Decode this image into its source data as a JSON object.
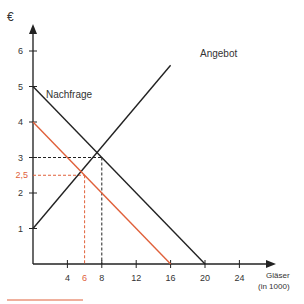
{
  "chart_data": {
    "type": "line",
    "title": "",
    "xlabel": "Gläser (in 1000)",
    "xlabel_line1": "Gläser",
    "xlabel_line2": "(in 1000)",
    "ylabel": "€",
    "xlim": [
      0,
      26
    ],
    "ylim": [
      0,
      6.8
    ],
    "x_ticks": [
      4,
      8,
      12,
      16,
      20,
      24
    ],
    "y_ticks": [
      1,
      2,
      3,
      4,
      5,
      6
    ],
    "grid": false,
    "series": [
      {
        "name": "Nachfrage",
        "color": "#222222",
        "points": [
          [
            0,
            5
          ],
          [
            20,
            0
          ]
        ]
      },
      {
        "name": "Angebot",
        "color": "#222222",
        "points": [
          [
            0,
            1
          ],
          [
            16,
            5.6
          ]
        ]
      },
      {
        "name": "Nachfrage (neu)",
        "color": "#e0603a",
        "points": [
          [
            0,
            4
          ],
          [
            16,
            0
          ]
        ]
      }
    ],
    "annotations": [
      {
        "type": "equilibrium",
        "x": 8,
        "y": 3,
        "color": "#222222",
        "style": "dashed"
      },
      {
        "type": "equilibrium",
        "x": 6,
        "y": 2.5,
        "color": "#e0603a",
        "style": "dashed",
        "x_label": "6",
        "y_label": "2,5"
      }
    ],
    "labels": {
      "demand": "Nachfrage",
      "supply": "Angebot"
    }
  },
  "legend_line_color": "#e0603a"
}
